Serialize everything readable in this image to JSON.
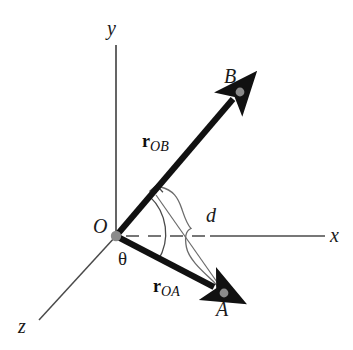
{
  "figure": {
    "kind": "vector-diagram",
    "background_color": "#ffffff"
  },
  "colors": {
    "axis": "#4a4a4a",
    "vector": "#111111",
    "thin_line": "#6b6b6b",
    "point_dot": "#8a8a8a",
    "text": "#1a1a1a"
  },
  "axes": [
    {
      "id": "y-axis",
      "label": "y",
      "label_x": 107,
      "label_y": 18,
      "from": [
        116,
        45
      ],
      "to": [
        116,
        236
      ],
      "style": "solid"
    },
    {
      "id": "x-axis",
      "label": "x",
      "label_x": 330,
      "label_y": 225,
      "from": [
        116,
        236
      ],
      "to": [
        325,
        236
      ],
      "style": "dashed-then-solid"
    },
    {
      "id": "z-axis",
      "label": "z",
      "label_x": 18,
      "label_y": 316,
      "from": [
        116,
        236
      ],
      "to": [
        39,
        320
      ],
      "style": "solid"
    }
  ],
  "origin": {
    "label": "O",
    "label_x": 93,
    "label_y": 216,
    "point": [
      116,
      236
    ]
  },
  "points": [
    {
      "id": "point-b",
      "label": "B",
      "label_x": 224,
      "label_y": 66,
      "point": [
        240,
        92
      ]
    },
    {
      "id": "point-a",
      "label": "A",
      "label_x": 216,
      "label_y": 299,
      "point": [
        224,
        293
      ]
    }
  ],
  "vectors": [
    {
      "id": "vector-ob",
      "symbol": "r",
      "subscript": "OB",
      "label_x": 142,
      "label_y": 132,
      "from": [
        116,
        236
      ],
      "to": [
        238,
        94
      ],
      "arrowhead": true
    },
    {
      "id": "vector-oa",
      "symbol": "r",
      "subscript": "OA",
      "label_x": 153,
      "label_y": 277,
      "from": [
        116,
        236
      ],
      "to": [
        222,
        291
      ],
      "arrowhead": true
    }
  ],
  "annotations": {
    "angle": {
      "id": "angle-theta",
      "label": "θ",
      "label_x": 118,
      "label_y": 249,
      "between": [
        "vector-ob",
        "vector-oa"
      ],
      "arc_radius": 42
    },
    "distance": {
      "id": "distance-d",
      "label": "d",
      "label_x": 206,
      "label_y": 205,
      "meaning": "perpendicular distance from point A to vector r_OB",
      "brace_from": [
        160,
        188
      ],
      "brace_to": [
        224,
        291
      ]
    },
    "right_angle": {
      "id": "right-angle-mark",
      "label": "",
      "vertex": [
        155,
        196
      ],
      "size": 11,
      "meaning": "perpendicular foot of d on r_OB"
    }
  }
}
